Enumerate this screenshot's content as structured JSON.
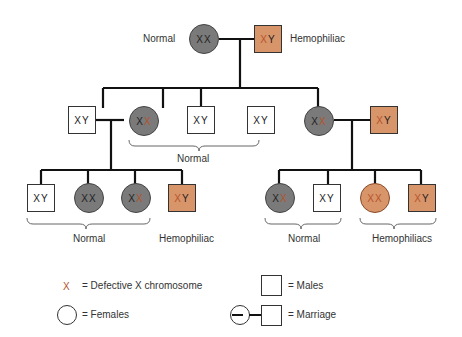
{
  "colors": {
    "line": "#111111",
    "female_fill": "#7a7a7a",
    "affected_fill": "#d9956a",
    "defective_x": "#b5532b",
    "male_fill": "#ffffff"
  },
  "labels": {
    "gen1_mother": "Normal",
    "gen1_father": "Hemophiliac",
    "gen2_group": "Normal",
    "gen3_left_group": "Normal",
    "gen3_left_affected": "Hemophiliac",
    "gen3_right_group1": "Normal",
    "gen3_right_group2": "Hemophiliacs"
  },
  "chrom": {
    "X": "X",
    "Y": "Y"
  },
  "legend": {
    "defective_symbol": "X",
    "defective_text": "= Defective X chromosome",
    "females_text": "= Females",
    "males_text": "= Males",
    "marriage_text": "= Marriage"
  }
}
